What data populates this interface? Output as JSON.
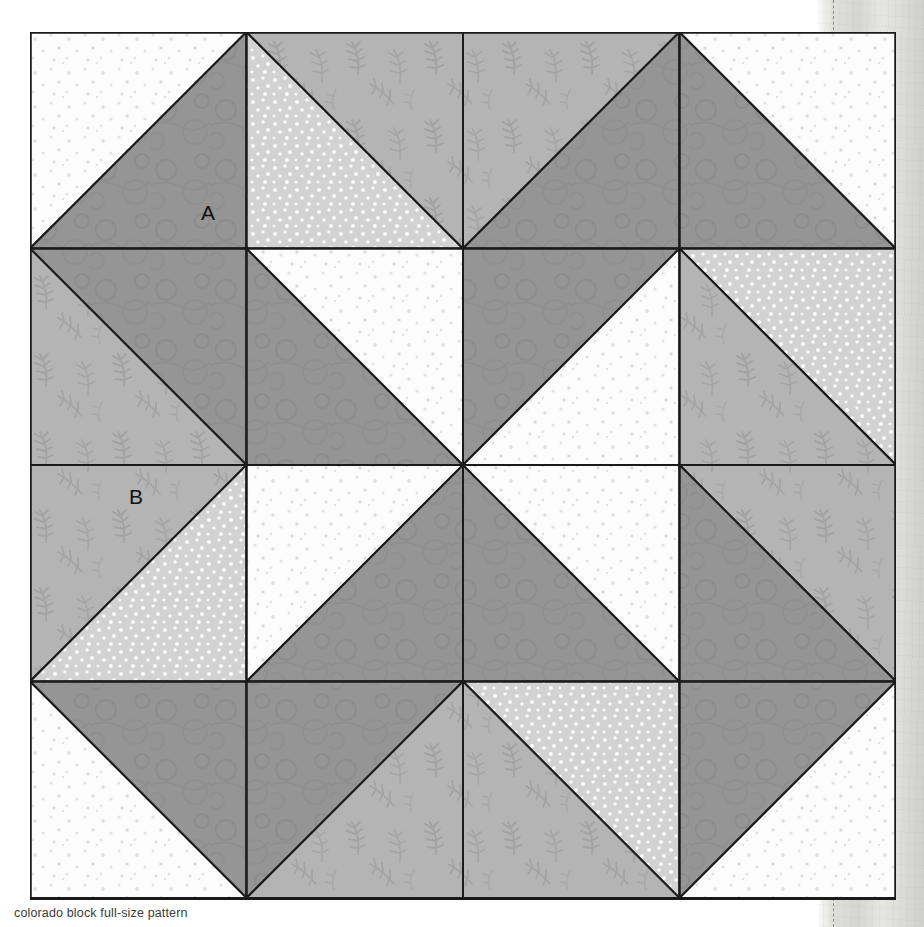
{
  "caption": "colorado block full-size pattern",
  "block": {
    "name": "colorado-block",
    "grid": {
      "columns": 4,
      "rows": 4,
      "cell_size": 216.5
    },
    "outline_color": "#1a1a1a"
  },
  "fabrics": [
    {
      "key": "white_dot",
      "label": "white with tiny dots",
      "color": "#fcfcfc",
      "dot_color": "#dcdcdc"
    },
    {
      "key": "light_dot",
      "label": "light gray with white dots",
      "color": "#d2d2d2",
      "dot_color": "#ffffff"
    },
    {
      "key": "medium",
      "label": "medium gray tonal",
      "color": "#959595",
      "dot_color": "#8c8c8c"
    },
    {
      "key": "leaf",
      "label": "light gray leaf print",
      "color": "#b4b4b4",
      "dot_color": "#a2a2a2"
    }
  ],
  "labels": [
    {
      "id": "A",
      "text": "A",
      "x": 178,
      "y": 188,
      "fabric": "medium",
      "note": "corner triangle patch"
    },
    {
      "id": "B",
      "text": "B",
      "x": 106,
      "y": 472,
      "fabric": "leaf",
      "note": "side square patch"
    }
  ],
  "patches": [
    {
      "name": "r1c1-white-square",
      "fabric": "white_dot",
      "points": "0,0 216.5,0 0,216.5"
    },
    {
      "name": "r1c1-medium-triangle",
      "fabric": "medium",
      "points": "216.5,0 216.5,216.5 0,216.5"
    },
    {
      "name": "r1c2-light-triangle",
      "fabric": "light_dot",
      "points": "216.5,0 216.5,216.5 433,216.5"
    },
    {
      "name": "r1c2-leaf-triangle",
      "fabric": "leaf",
      "points": "216.5,0 433,0 433,216.5"
    },
    {
      "name": "r1c3-leaf-triangle",
      "fabric": "leaf",
      "points": "433,0 649.5,0 433,216.5"
    },
    {
      "name": "r1c3-medium-triangle",
      "fabric": "medium",
      "points": "649.5,0 649.5,216.5 433,216.5"
    },
    {
      "name": "r1c4-medium-triangle",
      "fabric": "medium",
      "points": "649.5,0 649.5,216.5 866,216.5"
    },
    {
      "name": "r1c4-white-triangle",
      "fabric": "white_dot",
      "points": "649.5,0 866,0 866,216.5"
    },
    {
      "name": "r2c1-medium-triangle",
      "fabric": "medium",
      "points": "0,216.5 216.5,216.5 216.5,433"
    },
    {
      "name": "r2c1-leaf-triangle",
      "fabric": "leaf",
      "points": "0,216.5 216.5,433 0,433"
    },
    {
      "name": "r2c2-medium-triangle",
      "fabric": "medium",
      "points": "216.5,216.5 433,433 216.5,433"
    },
    {
      "name": "r2c2-white-triangle",
      "fabric": "white_dot",
      "points": "216.5,216.5 433,216.5 433,433"
    },
    {
      "name": "r2c3-medium-triangle",
      "fabric": "medium",
      "points": "433,216.5 649.5,216.5 433,433"
    },
    {
      "name": "r2c3-white-triangle",
      "fabric": "white_dot",
      "points": "649.5,216.5 649.5,433 433,433"
    },
    {
      "name": "r2c4-light-triangle",
      "fabric": "light_dot",
      "points": "649.5,216.5 866,216.5 866,433"
    },
    {
      "name": "r2c4-leaf-triangle",
      "fabric": "leaf",
      "points": "649.5,216.5 866,433 649.5,433"
    },
    {
      "name": "r3c1-leaf-triangle",
      "fabric": "leaf",
      "points": "0,433 216.5,433 0,649.5"
    },
    {
      "name": "r3c1-light-triangle",
      "fabric": "light_dot",
      "points": "216.5,433 216.5,649.5 0,649.5"
    },
    {
      "name": "r3c2-white-triangle",
      "fabric": "white_dot",
      "points": "216.5,433 433,433 216.5,649.5"
    },
    {
      "name": "r3c2-medium-triangle",
      "fabric": "medium",
      "points": "433,433 433,649.5 216.5,649.5"
    },
    {
      "name": "r3c3-medium-triangle",
      "fabric": "medium",
      "points": "433,433 649.5,649.5 433,649.5"
    },
    {
      "name": "r3c3-white-triangle",
      "fabric": "white_dot",
      "points": "433,433 649.5,433 649.5,649.5"
    },
    {
      "name": "r3c4-leaf-triangle",
      "fabric": "leaf",
      "points": "649.5,433 866,433 866,649.5"
    },
    {
      "name": "r3c4-medium-triangle",
      "fabric": "medium",
      "points": "649.5,433 866,649.5 649.5,649.5"
    },
    {
      "name": "r4c1-medium-triangle",
      "fabric": "medium",
      "points": "0,649.5 216.5,649.5 216.5,866"
    },
    {
      "name": "r4c1-white-triangle",
      "fabric": "white_dot",
      "points": "0,649.5 216.5,866 0,866"
    },
    {
      "name": "r4c2-medium-triangle",
      "fabric": "medium",
      "points": "216.5,649.5 433,649.5 216.5,866"
    },
    {
      "name": "r4c2-leaf-triangle",
      "fabric": "leaf",
      "points": "433,649.5 433,866 216.5,866"
    },
    {
      "name": "r4c3-light-triangle",
      "fabric": "light_dot",
      "points": "433,649.5 649.5,649.5 649.5,866"
    },
    {
      "name": "r4c3-leaf-triangle",
      "fabric": "leaf",
      "points": "433,649.5 649.5,866 433,866"
    },
    {
      "name": "r4c4-medium-triangle",
      "fabric": "medium",
      "points": "649.5,649.5 866,649.5 649.5,866"
    },
    {
      "name": "r4c4-white-triangle",
      "fabric": "white_dot",
      "points": "866,649.5 866,866 649.5,866"
    }
  ],
  "seam_lines": [
    {
      "name": "seam-h-1",
      "x1": 0,
      "y1": 216.5,
      "x2": 866,
      "y2": 216.5
    },
    {
      "name": "seam-h-2",
      "x1": 0,
      "y1": 433,
      "x2": 866,
      "y2": 433
    },
    {
      "name": "seam-h-3",
      "x1": 0,
      "y1": 649.5,
      "x2": 866,
      "y2": 649.5
    },
    {
      "name": "seam-v-1",
      "x1": 216.5,
      "y1": 0,
      "x2": 216.5,
      "y2": 866
    },
    {
      "name": "seam-v-2",
      "x1": 433,
      "y1": 0,
      "x2": 433,
      "y2": 866
    },
    {
      "name": "seam-v-3",
      "x1": 649.5,
      "y1": 0,
      "x2": 649.5,
      "y2": 866
    }
  ]
}
